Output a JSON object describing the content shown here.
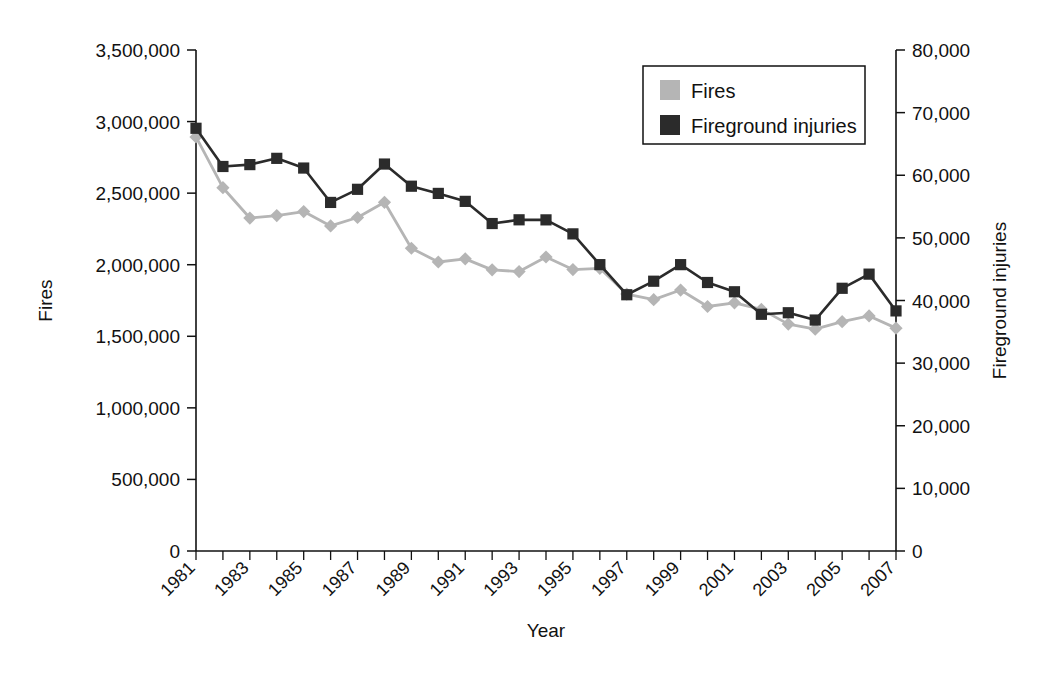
{
  "chart_data": {
    "type": "line",
    "title": "",
    "xlabel": "Year",
    "ylabel": "Fires",
    "y2label": "Fireground injuries",
    "grid": false,
    "legend_position": "top-right",
    "x": [
      1981,
      1982,
      1983,
      1984,
      1985,
      1986,
      1987,
      1988,
      1989,
      1990,
      1991,
      1992,
      1993,
      1994,
      1995,
      1996,
      1997,
      1998,
      1999,
      2000,
      2001,
      2002,
      2003,
      2004,
      2005,
      2006,
      2007
    ],
    "xtick_labels": [
      "1981",
      "1983",
      "1985",
      "1987",
      "1989",
      "1991",
      "1993",
      "1995",
      "1997",
      "1999",
      "2001",
      "2003",
      "2005",
      "2007"
    ],
    "xlim": [
      1981,
      2007
    ],
    "ylim": [
      0,
      3500000
    ],
    "ytick_labels": [
      "0",
      "500,000",
      "1,000,000",
      "1,500,000",
      "2,000,000",
      "2,500,000",
      "3,000,000",
      "3,500,000"
    ],
    "ytick_values": [
      0,
      500000,
      1000000,
      1500000,
      2000000,
      2500000,
      3000000,
      3500000
    ],
    "y2lim": [
      0,
      80000
    ],
    "y2tick_labels": [
      "0",
      "10,000",
      "20,000",
      "30,000",
      "40,000",
      "50,000",
      "60,000",
      "70,000",
      "80,000"
    ],
    "y2tick_values": [
      0,
      10000,
      20000,
      30000,
      40000,
      50000,
      60000,
      70000,
      80000
    ],
    "series": [
      {
        "name": "Fires",
        "axis": "left",
        "color": "#b5b5b5",
        "marker": "diamond",
        "values": [
          2893000,
          2538000,
          2326000,
          2343000,
          2371000,
          2271000,
          2330000,
          2436000,
          2115000,
          2019000,
          2041000,
          1964000,
          1952000,
          2054000,
          1966000,
          1975000,
          1795000,
          1756000,
          1823000,
          1708000,
          1734000,
          1688000,
          1585000,
          1550000,
          1602000,
          1642000,
          1557000
        ]
      },
      {
        "name": "Fireground injuries",
        "axis": "right",
        "color": "#2b2b2b",
        "marker": "square",
        "values": [
          67500,
          61400,
          61700,
          62700,
          61150,
          55660,
          57755,
          61790,
          58250,
          57100,
          55830,
          52290,
          52885,
          52875,
          50640,
          45725,
          40920,
          43080,
          45725,
          42875,
          41395,
          37800,
          38045,
          36880,
          41950,
          44210,
          38340
        ]
      }
    ]
  },
  "legend": {
    "items": [
      {
        "label": "Fires",
        "color": "#b5b5b5"
      },
      {
        "label": "Fireground injuries",
        "color": "#2b2b2b"
      }
    ]
  }
}
